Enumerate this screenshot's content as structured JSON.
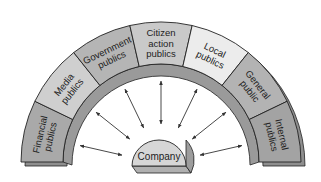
{
  "diagram": {
    "type": "arch-of-publics",
    "center": {
      "label": "Company"
    },
    "segments": [
      {
        "id": "financial",
        "lines": [
          "Financial",
          "publics"
        ],
        "fill": "#a9a9a9"
      },
      {
        "id": "media",
        "lines": [
          "Media",
          "publics"
        ],
        "fill": "#cfcfcf"
      },
      {
        "id": "government",
        "lines": [
          "Government",
          "publics"
        ],
        "fill": "#b5b5b5"
      },
      {
        "id": "citizen",
        "lines": [
          "Citizen",
          "action",
          "publics"
        ],
        "fill": "#c9c9c9"
      },
      {
        "id": "local",
        "lines": [
          "Local",
          "publics"
        ],
        "fill": "#ececec"
      },
      {
        "id": "general",
        "lines": [
          "General",
          "public"
        ],
        "fill": "#b3b3b3"
      },
      {
        "id": "internal",
        "lines": [
          "Internal",
          "publics"
        ],
        "fill": "#a3a3a3"
      }
    ],
    "arrows": "bidirectional",
    "colors": {
      "outline": "#222222",
      "depth_face": "#8e8e8e",
      "company_fill": "#d6d6d6",
      "company_depth": "#b0b0b0"
    }
  }
}
